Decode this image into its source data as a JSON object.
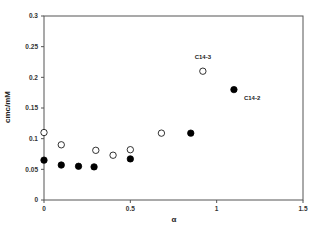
{
  "chart_data": {
    "type": "scatter",
    "title": "",
    "xlabel": "α",
    "ylabel": "cmc/mM",
    "xlim": [
      0,
      1.5
    ],
    "ylim": [
      0,
      0.3
    ],
    "xticks": [
      0,
      0.5,
      1,
      1.5
    ],
    "xtick_labels": [
      "0",
      "0.5",
      "1",
      "1.5"
    ],
    "yticks": [
      0,
      0.05,
      0.1,
      0.15,
      0.2,
      0.25,
      0.3
    ],
    "ytick_labels": [
      "0",
      "0.05",
      "0.1",
      "0.15",
      "0.2",
      "0.25",
      "0.3"
    ],
    "grid": false,
    "legend": "none",
    "series": [
      {
        "name": "C14-3",
        "marker": "open-circle",
        "color": "#000000",
        "x": [
          0,
          0.1,
          0.3,
          0.4,
          0.5,
          0.68,
          0.92
        ],
        "y": [
          0.11,
          0.09,
          0.081,
          0.073,
          0.082,
          0.109,
          0.21
        ]
      },
      {
        "name": "C14-2",
        "marker": "filled-circle",
        "color": "#000000",
        "x": [
          0,
          0.1,
          0.2,
          0.29,
          0.5,
          0.85,
          1.1
        ],
        "y": [
          0.065,
          0.057,
          0.055,
          0.054,
          0.067,
          0.109,
          0.18
        ]
      }
    ],
    "annotations": [
      {
        "text": "C14-3",
        "series": "C14-3",
        "near_point": 6,
        "placement": "above"
      },
      {
        "text": "C14-2",
        "series": "C14-2",
        "near_point": 6,
        "placement": "below-right"
      }
    ]
  }
}
